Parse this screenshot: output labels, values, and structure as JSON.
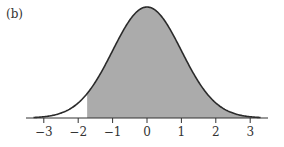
{
  "panel_label": "(b)",
  "chart_data": {
    "type": "area",
    "title": "",
    "xlabel": "",
    "ylabel": "",
    "xlim": [
      -3.5,
      3.5
    ],
    "x_ticks": [
      -3,
      -2,
      -1,
      0,
      1,
      2,
      3
    ],
    "x_tick_labels": [
      "−3",
      "−2",
      "−1",
      "0",
      "1",
      "2",
      "3"
    ],
    "shade_from": -1.74,
    "shade_to": 3.5,
    "grid": false,
    "legend": null,
    "curve": "normal(0,1)",
    "colors": {
      "curve": "#2b2b2b",
      "shade": "#ababab",
      "axis": "#333333"
    }
  }
}
